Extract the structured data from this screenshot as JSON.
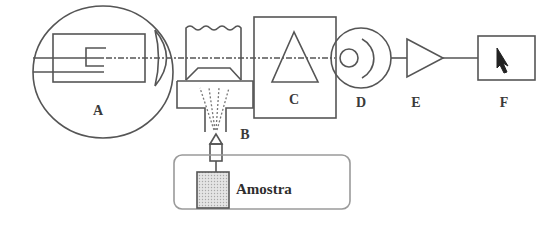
{
  "diagram": {
    "type": "atomic-absorption-spectrometer-schematic",
    "colors": {
      "stroke": "#555555",
      "sample_fill": "#c9c9c9",
      "sample_box_stroke": "#9a9a9a",
      "text": "#333333"
    },
    "components": [
      {
        "id": "A",
        "label": "A",
        "description": "hollow cathode lamp (light source)"
      },
      {
        "id": "B",
        "label": "B",
        "description": "nebulizer / burner (atomizer)"
      },
      {
        "id": "C",
        "label": "C",
        "description": "monochromator (prism)"
      },
      {
        "id": "D",
        "label": "D",
        "description": "detector"
      },
      {
        "id": "E",
        "label": "E",
        "description": "amplifier"
      },
      {
        "id": "F",
        "label": "F",
        "description": "readout"
      }
    ],
    "sample": {
      "label": "Amostra"
    },
    "connections": [
      {
        "from": "A",
        "to": "B"
      },
      {
        "from": "B",
        "to": "C"
      },
      {
        "from": "C",
        "to": "D"
      },
      {
        "from": "D",
        "to": "E"
      },
      {
        "from": "E",
        "to": "F"
      },
      {
        "from": "sample",
        "to": "B"
      }
    ]
  }
}
